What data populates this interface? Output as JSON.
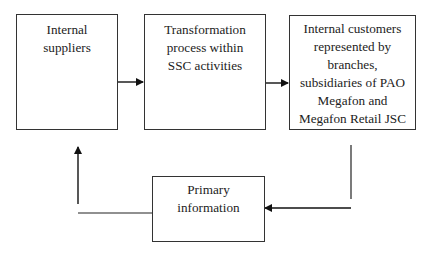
{
  "diagram": {
    "nodes": [
      {
        "id": "internal-suppliers",
        "label": "Internal\nsuppliers"
      },
      {
        "id": "transformation-process",
        "label": "Transformation\nprocess within\nSSC activities"
      },
      {
        "id": "internal-customers",
        "label": "Internal customers\nrepresented by\nbranches,\nsubsidiaries of PAO\nMegafon and\nMegafon Retail JSC"
      },
      {
        "id": "primary-information",
        "label": "Primary\ninformation"
      }
    ],
    "edges": [
      {
        "from": "internal-suppliers",
        "to": "transformation-process"
      },
      {
        "from": "transformation-process",
        "to": "internal-customers"
      },
      {
        "from": "internal-customers",
        "to": "primary-information"
      },
      {
        "from": "primary-information",
        "to": "internal-suppliers"
      }
    ],
    "colors": {
      "stroke": "#222222",
      "background": "#ffffff"
    }
  }
}
